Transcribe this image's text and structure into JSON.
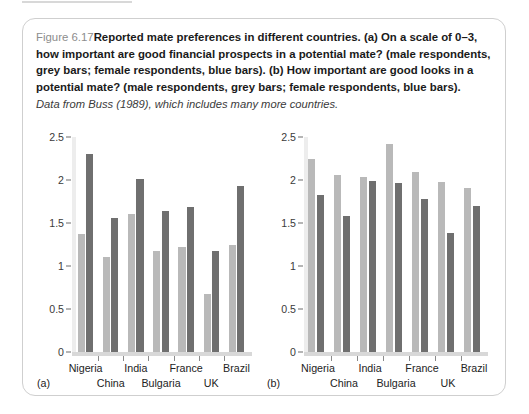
{
  "caption": {
    "figure_label": "Figure 6.17",
    "text": "Reported mate preferences in different countries. (a) On a scale of 0–3, how important are good financial prospects in a potential mate? (male respondents, grey bars; female respondents, blue bars). (b) How important are good looks in a potential mate? (male respondents, grey bars; female respondents, blue bars).",
    "source": "Data from Buss (1989), which includes many more countries."
  },
  "colors": {
    "male_bar": "#b9b9b9",
    "female_bar": "#6f6f6f",
    "box_border": "#cfcfcf",
    "axis": "#8a8a8a",
    "baseline": "#d8d8d8"
  },
  "panels": {
    "a": {
      "letter": "(a)"
    },
    "b": {
      "letter": "(b)"
    }
  },
  "chart_data": [
    {
      "type": "bar",
      "panel": "(a)",
      "title": "On a scale of 0–3, how important are good financial prospects in a potential mate?",
      "xlabel": "",
      "ylabel": "",
      "ylim": [
        0,
        2.5
      ],
      "yticks": [
        0,
        0.5,
        1,
        1.5,
        2,
        2.5
      ],
      "ytick_labels": [
        "0",
        "0.5",
        "1",
        "1.5",
        "2",
        "2.5"
      ],
      "grid": false,
      "legend": [
        "male respondents (grey bars)",
        "female respondents (blue bars)"
      ],
      "categories": [
        "Nigeria",
        "China",
        "India",
        "Bulgaria",
        "France",
        "UK",
        "Brazil"
      ],
      "series": [
        {
          "name": "male respondents",
          "values": [
            1.37,
            1.1,
            1.6,
            1.17,
            1.22,
            0.68,
            1.25
          ]
        },
        {
          "name": "female respondents",
          "values": [
            2.3,
            1.56,
            2.01,
            1.64,
            1.69,
            1.18,
            1.93
          ]
        }
      ]
    },
    {
      "type": "bar",
      "panel": "(b)",
      "title": "How important are good looks in a potential mate?",
      "xlabel": "",
      "ylabel": "",
      "ylim": [
        0,
        2.5
      ],
      "yticks": [
        0,
        0.5,
        1,
        1.5,
        2,
        2.5
      ],
      "ytick_labels": [
        "0",
        "0.5",
        "1",
        "1.5",
        "2",
        "2.5"
      ],
      "grid": false,
      "legend": [
        "male respondents (grey bars)",
        "female respondents (blue bars)"
      ],
      "categories": [
        "Nigeria",
        "China",
        "India",
        "Bulgaria",
        "France",
        "UK",
        "Brazil"
      ],
      "series": [
        {
          "name": "male respondents",
          "values": [
            2.24,
            2.06,
            2.03,
            2.42,
            2.09,
            1.98,
            1.91
          ]
        },
        {
          "name": "female respondents",
          "values": [
            1.83,
            1.58,
            1.99,
            1.96,
            1.78,
            1.38,
            1.7
          ]
        }
      ]
    }
  ]
}
